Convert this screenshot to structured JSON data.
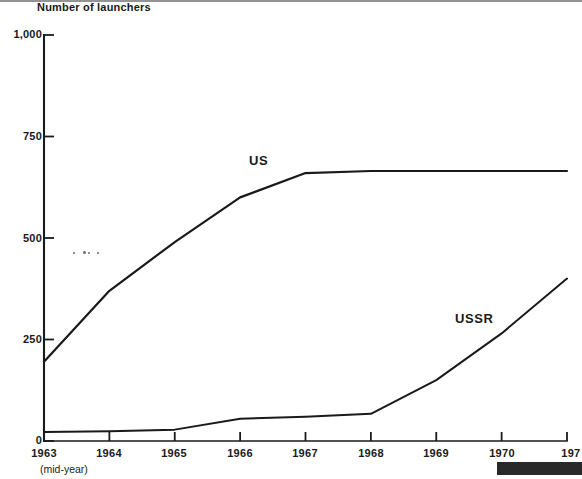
{
  "chart_data": {
    "type": "line",
    "title": "",
    "subtitle": "",
    "ylabel": "Number of launchers",
    "xlabel": "(mid-year)",
    "ylim": [
      0,
      1000
    ],
    "xlim": [
      1963,
      1971
    ],
    "grid": false,
    "legend_position": "inline-annotation",
    "ytick_labels": [
      "1,000",
      "750",
      "500",
      "250",
      "0"
    ],
    "ytick_values": [
      1000,
      750,
      500,
      250,
      0
    ],
    "xtick_labels": [
      "1963",
      "1964",
      "1965",
      "1966",
      "1967",
      "1968",
      "1969",
      "1970",
      "197"
    ],
    "xtick_values": [
      1963,
      1964,
      1965,
      1966,
      1967,
      1968,
      1969,
      1970,
      1971
    ],
    "x": [
      1963,
      1964,
      1965,
      1966,
      1967,
      1968,
      1969,
      1970,
      1971
    ],
    "series": [
      {
        "name": "US",
        "label": "US",
        "color": "#1a1a1a",
        "values": [
          195,
          370,
          490,
          600,
          660,
          665,
          665,
          665,
          665
        ]
      },
      {
        "name": "USSR",
        "label": "USSR",
        "color": "#1a1a1a",
        "values": [
          22,
          24,
          28,
          55,
          60,
          67,
          150,
          265,
          400
        ]
      }
    ],
    "annotations": [
      {
        "text": "US",
        "x": 1966.2,
        "y": 700
      },
      {
        "text": "USSR",
        "x": 1969.4,
        "y": 320
      }
    ]
  },
  "axes": {
    "y_axis_title": "Number of launchers",
    "x_axis_note": "(mid-year)"
  },
  "colors": {
    "line": "#1a1a1a",
    "axis": "#1a1a1a",
    "background": "#ffffff",
    "artifact": "#121212"
  }
}
